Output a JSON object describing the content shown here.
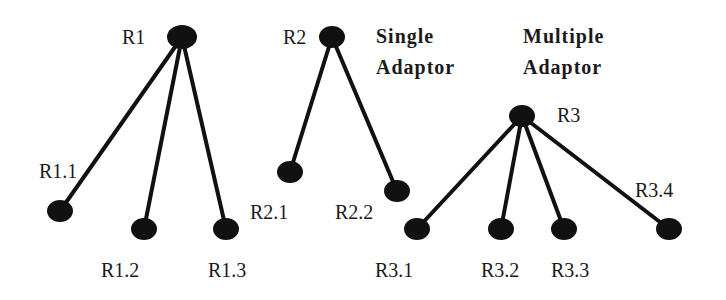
{
  "titles": {
    "single": [
      "Single",
      "Adaptor"
    ],
    "multiple": [
      "Multiple",
      "Adaptor"
    ]
  },
  "colors": {
    "node": "#111111",
    "edge": "#111111",
    "text": "#1a1a1a",
    "background": "#ffffff"
  },
  "trees": [
    {
      "root": {
        "label": "R1",
        "x": 182,
        "y": 37
      },
      "children": [
        {
          "label": "R1.1",
          "x": 60,
          "y": 211
        },
        {
          "label": "R1.2",
          "x": 144,
          "y": 229
        },
        {
          "label": "R1.3",
          "x": 226,
          "y": 229
        }
      ]
    },
    {
      "root": {
        "label": "R2",
        "x": 332,
        "y": 37
      },
      "children": [
        {
          "label": "R2.1",
          "x": 290,
          "y": 172
        },
        {
          "label": "R2.2",
          "x": 397,
          "y": 191
        }
      ]
    },
    {
      "root": {
        "label": "R3",
        "x": 522,
        "y": 116
      },
      "children": [
        {
          "label": "R3.1",
          "x": 417,
          "y": 229
        },
        {
          "label": "R3.2",
          "x": 501,
          "y": 229
        },
        {
          "label": "R3.3",
          "x": 564,
          "y": 229
        },
        {
          "label": "R3.4",
          "x": 669,
          "y": 229
        }
      ]
    }
  ]
}
